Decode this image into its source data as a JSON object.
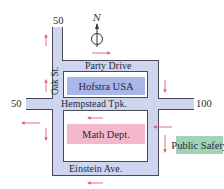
{
  "map": {
    "compass": {
      "label": "N",
      "icon": "north-arrow-icon"
    },
    "streets": {
      "oak": "Oak St.",
      "party": "Party Drive",
      "hempstead": "Hempstead Tpk.",
      "einstein": "Einstein Ave."
    },
    "buildings": {
      "hofstra": {
        "label": "Hofstra USA",
        "color": "#a9b6e8"
      },
      "math": {
        "label": "Math Dept.",
        "color": "#f4b8cc"
      },
      "safety": {
        "label": "Public Safety",
        "color": "#9fd3b6"
      }
    },
    "markers": {
      "top_50": "50",
      "left_50": "50",
      "right_100": "100"
    },
    "colors": {
      "road": "#cdd6ee",
      "road_edge": "#4a4a55",
      "arrow": "#e0607a"
    }
  }
}
